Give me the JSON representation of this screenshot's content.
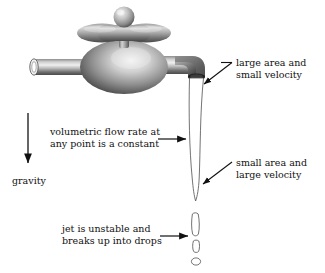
{
  "figure": {
    "background_color": "#ffffff",
    "text_color": "#111111",
    "width": 325,
    "height": 273
  },
  "annotations": {
    "large_area": {
      "line1": "large area and",
      "line2": "small velocity",
      "arrow": "points down-left to spout opening"
    },
    "small_area": {
      "line1": "small area and",
      "line2": "large velocity",
      "arrow": "points down-left to narrow jet"
    },
    "flow_rate": {
      "line1": "volumetric flow rate at",
      "line2": "any point is a constant",
      "arrow": "points right to jet"
    },
    "jet_breakup": {
      "line1": "jet is unstable and",
      "line2": "breaks up into drops",
      "arrow": "points right to drops"
    },
    "gravity": {
      "label": "gravity",
      "arrow": "points down"
    }
  },
  "graphics": {
    "faucet": {
      "name": "faucet",
      "metal_light": "#e8e8e8",
      "metal_mid": "#9a9a9a",
      "metal_dark": "#3a3a3a",
      "parts": [
        "knob-sphere",
        "handle-bowtie",
        "stem",
        "body-ellipse",
        "inlet-pipe",
        "outlet-pipe",
        "elbow",
        "spout-opening"
      ]
    },
    "water": {
      "name": "water-jet",
      "stroke": "#555555",
      "fill": "#ffffff",
      "parts": [
        "tapering-stream",
        "drop-elongated",
        "drop-small",
        "drop-round"
      ]
    }
  }
}
